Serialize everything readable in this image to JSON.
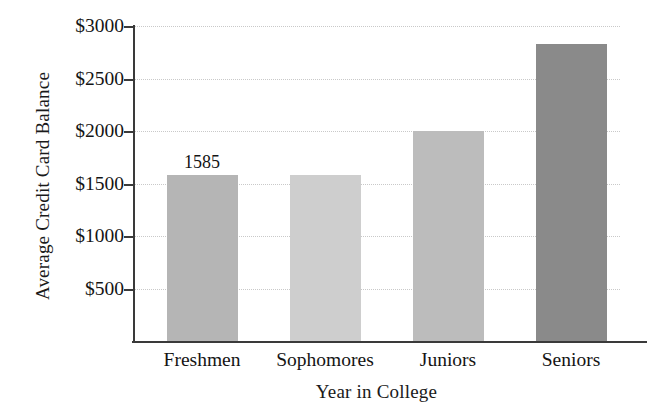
{
  "chart_data": {
    "type": "bar",
    "title": "",
    "xlabel": "Year in College",
    "ylabel": "Average Credit Card Balance",
    "categories": [
      "Freshmen",
      "Sophomores",
      "Juniors",
      "Seniors"
    ],
    "values": [
      1585,
      1580,
      2000,
      2830
    ],
    "value_labels": [
      "1585",
      "",
      "",
      ""
    ],
    "ylim": [
      0,
      3000
    ],
    "ytick_values": [
      500,
      1000,
      1500,
      2000,
      2500,
      3000
    ],
    "ytick_labels": [
      "$500",
      "$1000",
      "$1500",
      "$2000",
      "$2500",
      "$3000"
    ],
    "grid": true,
    "grid_style": "dotted",
    "legend": "none",
    "bar_colors": [
      "#b5b5b5",
      "#cecece",
      "#bcbcbc",
      "#8a8a8a"
    ],
    "axis_color": "#3a3a3a",
    "grid_color": "#c9c9c9",
    "background": "#ffffff"
  }
}
